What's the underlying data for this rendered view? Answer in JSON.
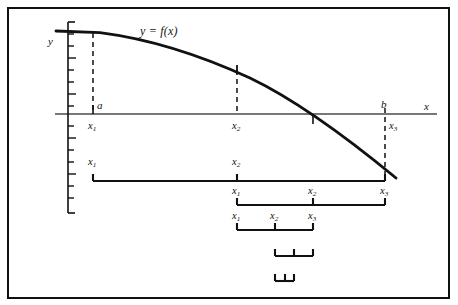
{
  "figure": {
    "caption_remnant": "",
    "background": "#ffffff",
    "ink": "#111111",
    "axis_color": "#4a4a4a",
    "frame_color": "#111111"
  },
  "axes": {
    "y_axis_label": "y",
    "x_axis_label": "x",
    "y_axis_ticks": 16,
    "x_axis_y": 114,
    "y_axis_x": 68
  },
  "curve": {
    "label": "y = f(x)",
    "type": "decreasing-concave-down",
    "points": [
      [
        68,
        32
      ],
      [
        100,
        33
      ],
      [
        140,
        38
      ],
      [
        180,
        48
      ],
      [
        220,
        63
      ],
      [
        260,
        83
      ],
      [
        300,
        106
      ],
      [
        340,
        134
      ],
      [
        370,
        157
      ],
      [
        396,
        178
      ]
    ]
  },
  "interval_endpoints": {
    "a_label": "a",
    "b_label": "b"
  },
  "axis_marks": [
    {
      "name": "x1",
      "label": "x",
      "sub": "1",
      "x": 93,
      "dashed_from": "curve",
      "tick": true
    },
    {
      "name": "x2",
      "label": "x",
      "sub": "2",
      "x": 237,
      "dashed_from": "curve",
      "tick": true
    },
    {
      "name": "x3",
      "label": "x",
      "sub": "3",
      "x": 385,
      "dashed_from": "axis",
      "tick": true
    },
    {
      "name": "xr",
      "label": "",
      "sub": "",
      "x": 313,
      "dashed_from": "none",
      "tick": true
    }
  ],
  "brackets": [
    {
      "id": "bracket-1",
      "y": 181,
      "left": 93,
      "right": 385,
      "ticks": [
        237
      ],
      "labels": [
        {
          "text": "x",
          "sub": "1",
          "x": 93
        },
        {
          "text": "x",
          "sub": "2",
          "x": 237
        }
      ]
    },
    {
      "id": "bracket-2",
      "y": 205,
      "left": 237,
      "right": 385,
      "ticks": [
        313
      ],
      "labels": [
        {
          "text": "x",
          "sub": "1",
          "x": 237
        },
        {
          "text": "x",
          "sub": "2",
          "x": 313
        },
        {
          "text": "x",
          "sub": "3",
          "x": 385
        }
      ]
    },
    {
      "id": "bracket-3",
      "y": 230,
      "left": 237,
      "right": 313,
      "ticks": [
        275
      ],
      "labels": [
        {
          "text": "x",
          "sub": "1",
          "x": 237
        },
        {
          "text": "x",
          "sub": "2",
          "x": 275
        },
        {
          "text": "x",
          "sub": "3",
          "x": 313
        }
      ]
    },
    {
      "id": "bracket-4",
      "y": 256,
      "left": 275,
      "right": 313,
      "ticks": [
        294
      ],
      "labels": []
    },
    {
      "id": "bracket-5",
      "y": 281,
      "left": 275,
      "right": 294,
      "ticks": [
        285
      ],
      "labels": []
    }
  ]
}
